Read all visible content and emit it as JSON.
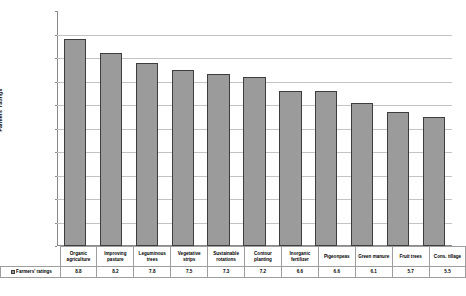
{
  "chart_data": {
    "type": "bar",
    "title": "",
    "xlabel": "",
    "ylabel": "Farmers' ratings",
    "ylim": [
      0,
      10
    ],
    "ytick_labels": [
      "10",
      "9",
      "8",
      "7",
      "6",
      "5",
      "4",
      "3",
      "2",
      "1",
      "0"
    ],
    "grid": true,
    "legend_position": "bottom-left",
    "series": [
      {
        "name": "Farmers' ratings",
        "color": "#9b9b9b",
        "values": [
          8.8,
          8.2,
          7.8,
          7.5,
          7.3,
          7.2,
          6.6,
          6.6,
          6.1,
          5.7,
          5.5
        ]
      }
    ],
    "categories": [
      "Organic agriculture",
      "Improving pasture",
      "Leguminous trees",
      "Vegetative strips",
      "Sustainable rotations",
      "Contour planting",
      "Inorganic fertilizer",
      "Pigeonpeas",
      "Green manure",
      "Fruit trees",
      "Cons. tillage"
    ],
    "value_labels": [
      "8.8",
      "8.2",
      "7.8",
      "7.5",
      "7.3",
      "7.2",
      "6.6",
      "6.6",
      "6.1",
      "5.7",
      "5.5"
    ]
  },
  "legend": {
    "label": "Farmers' ratings"
  }
}
